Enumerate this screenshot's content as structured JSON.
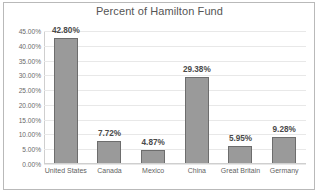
{
  "chart_data": {
    "type": "bar",
    "title": "Percent of Hamilton Fund",
    "xlabel": "",
    "ylabel": "",
    "categories": [
      "United States",
      "Canada",
      "Mexico",
      "China",
      "Great Britain",
      "Germany"
    ],
    "values": [
      42.8,
      7.72,
      4.87,
      29.38,
      5.95,
      9.28
    ],
    "data_labels": [
      "42.80%",
      "7.72%",
      "4.87%",
      "29.38%",
      "5.95%",
      "9.28%"
    ],
    "ylim": [
      0,
      45
    ],
    "ytick_values": [
      45,
      40,
      35,
      30,
      25,
      20,
      15,
      10,
      5,
      0
    ],
    "ytick_labels": [
      "45.00%",
      "40.00%",
      "35.00%",
      "30.00%",
      "25.00%",
      "20.00%",
      "15.00%",
      "10.00%",
      "5.00%",
      "0.00%"
    ],
    "grid": true,
    "legend": false,
    "legend_position": "none",
    "colors": {
      "bar_fill": "#9a9a9a",
      "bar_border": "#6d6d6d",
      "gridline": "#e8e8e8",
      "axis": "#cfcfcf",
      "title_text": "#555555",
      "tick_text": "#6a6a6a",
      "label_text": "#4a4a4a",
      "frame": "#b9b9b9",
      "background": "#ffffff"
    }
  }
}
